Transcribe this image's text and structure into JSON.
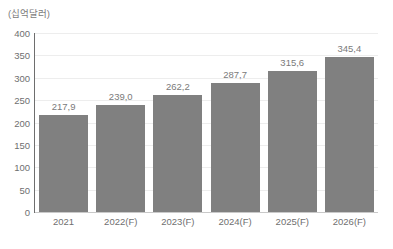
{
  "chart_data": {
    "type": "bar",
    "title": "",
    "subtitle": "",
    "xlabel": "",
    "ylabel": "(십억달러)",
    "ylim": [
      0,
      400
    ],
    "ytick_step": 50,
    "yticks": [
      "400",
      "350",
      "300",
      "250",
      "200",
      "150",
      "100",
      "50",
      "0"
    ],
    "grid": true,
    "legend": "none",
    "categories": [
      "2021",
      "2022(F)",
      "2023(F)",
      "2024(F)",
      "2025(F)",
      "2026(F)"
    ],
    "values": [
      217.9,
      239.0,
      262.2,
      287.7,
      315.6,
      345.4
    ],
    "value_labels": [
      "217,9",
      "239,0",
      "262,2",
      "287,7",
      "315,6",
      "345,4"
    ],
    "bar_color": "#808080",
    "grid_color": "#ededed",
    "axis_color": "#6e6e6e",
    "baseline_color": "#c9c9c9",
    "text_color": "#6f6f6f",
    "background": "#ffffff"
  }
}
